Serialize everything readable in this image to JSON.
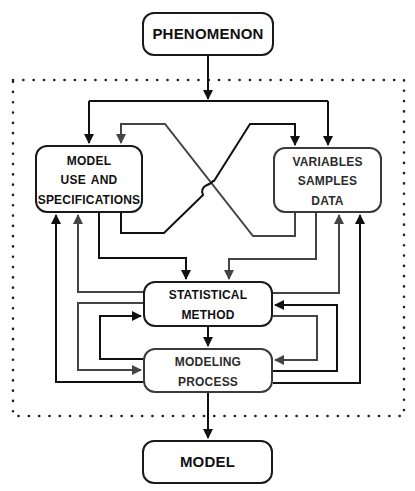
{
  "diagram": {
    "type": "flowchart",
    "nodes": {
      "phenomenon": {
        "lines": [
          "PHENOMENON"
        ]
      },
      "model_use": {
        "lines": [
          "Model",
          "Use and",
          "Specifications"
        ]
      },
      "variables": {
        "lines": [
          "Variables",
          "Samples",
          "Data"
        ]
      },
      "statistical_method": {
        "lines": [
          "Statistical",
          "Method"
        ]
      },
      "modeling_process": {
        "lines": [
          "Modeling",
          "Process"
        ]
      },
      "model": {
        "lines": [
          "MODEL"
        ]
      }
    },
    "edges": [
      {
        "from": "phenomenon",
        "to": "model_use"
      },
      {
        "from": "phenomenon",
        "to": "variables"
      },
      {
        "from": "model_use",
        "to": "variables",
        "style": "black",
        "crossing": true
      },
      {
        "from": "variables",
        "to": "model_use",
        "style": "gray",
        "crossing": true
      },
      {
        "from": "model_use",
        "to": "statistical_method",
        "style": "black"
      },
      {
        "from": "variables",
        "to": "statistical_method",
        "style": "gray"
      },
      {
        "from": "statistical_method",
        "to": "model_use",
        "style": "gray"
      },
      {
        "from": "statistical_method",
        "to": "variables",
        "style": "gray"
      },
      {
        "from": "modeling_process",
        "to": "model_use",
        "style": "black"
      },
      {
        "from": "modeling_process",
        "to": "variables",
        "style": "black"
      },
      {
        "from": "statistical_method",
        "to": "modeling_process",
        "style": "black"
      },
      {
        "from": "statistical_method",
        "to": "modeling_process",
        "style": "gray",
        "side": "left"
      },
      {
        "from": "modeling_process",
        "to": "statistical_method",
        "style": "black",
        "side": "left"
      },
      {
        "from": "statistical_method",
        "to": "modeling_process",
        "style": "gray",
        "side": "right"
      },
      {
        "from": "modeling_process",
        "to": "statistical_method",
        "style": "black",
        "side": "right"
      },
      {
        "from": "modeling_process",
        "to": "model"
      }
    ],
    "colors": {
      "black_line": "#111111",
      "gray_line": "#555555",
      "frame_dots": "#222222",
      "background": "#ffffff"
    }
  }
}
